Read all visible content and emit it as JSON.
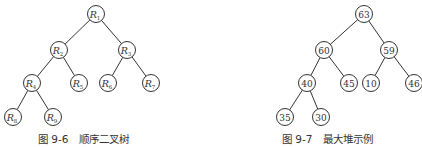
{
  "figures": [
    {
      "caption": "图 9-6   顺序二叉树",
      "nodes": [
        {
          "id": "R1",
          "label": "R",
          "sub": "1",
          "x": 96,
          "y": 14
        },
        {
          "id": "R2",
          "label": "R",
          "sub": "2",
          "x": 59,
          "y": 50
        },
        {
          "id": "R3",
          "label": "R",
          "sub": "3",
          "x": 127,
          "y": 50
        },
        {
          "id": "R4",
          "label": "R",
          "sub": "4",
          "x": 32,
          "y": 83
        },
        {
          "id": "R5",
          "label": "R",
          "sub": "5",
          "x": 79,
          "y": 83
        },
        {
          "id": "R6",
          "label": "R",
          "sub": "6",
          "x": 108,
          "y": 83
        },
        {
          "id": "R7",
          "label": "R",
          "sub": "7",
          "x": 151,
          "y": 83
        },
        {
          "id": "R8",
          "label": "R",
          "sub": "8",
          "x": 13,
          "y": 117
        },
        {
          "id": "R9",
          "label": "R",
          "sub": "9",
          "x": 53,
          "y": 117
        }
      ],
      "edges": [
        [
          "R1",
          "R2"
        ],
        [
          "R1",
          "R3"
        ],
        [
          "R2",
          "R4"
        ],
        [
          "R2",
          "R5"
        ],
        [
          "R3",
          "R6"
        ],
        [
          "R3",
          "R7"
        ],
        [
          "R4",
          "R8"
        ],
        [
          "R4",
          "R9"
        ]
      ]
    },
    {
      "caption": "图 9-7   最大堆示例",
      "nodes": [
        {
          "id": "n63",
          "label": "63",
          "x": 364,
          "y": 14
        },
        {
          "id": "n60",
          "label": "60",
          "x": 324,
          "y": 50
        },
        {
          "id": "n59",
          "label": "59",
          "x": 389,
          "y": 50
        },
        {
          "id": "n40",
          "label": "40",
          "x": 307,
          "y": 83
        },
        {
          "id": "n45",
          "label": "45",
          "x": 349,
          "y": 83
        },
        {
          "id": "n10",
          "label": "10",
          "x": 371,
          "y": 83
        },
        {
          "id": "n46",
          "label": "46",
          "x": 414,
          "y": 83
        },
        {
          "id": "n35",
          "label": "35",
          "x": 285,
          "y": 117
        },
        {
          "id": "n30",
          "label": "30",
          "x": 321,
          "y": 117
        }
      ],
      "edges": [
        [
          "n63",
          "n60"
        ],
        [
          "n63",
          "n59"
        ],
        [
          "n60",
          "n40"
        ],
        [
          "n60",
          "n45"
        ],
        [
          "n59",
          "n10"
        ],
        [
          "n59",
          "n46"
        ],
        [
          "n40",
          "n35"
        ],
        [
          "n40",
          "n30"
        ]
      ]
    }
  ],
  "style": {
    "stroke": "#333333",
    "node_radius": 8.5
  }
}
